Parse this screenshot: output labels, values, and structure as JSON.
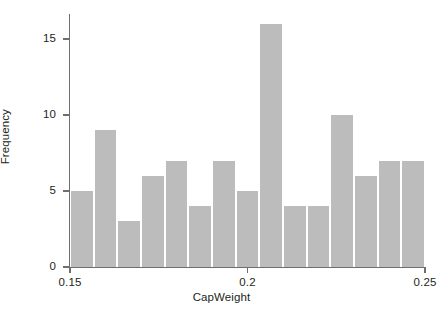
{
  "chart_data": {
    "type": "bar",
    "title": "",
    "subtitle": "",
    "xlabel": "CapWeight",
    "ylabel": "Frequency",
    "grid": false,
    "legend": null,
    "xlim": [
      0.15,
      0.25
    ],
    "ylim": [
      0,
      16.6
    ],
    "x_tick_labels": [
      "0.15",
      "0.2",
      "0.25"
    ],
    "x_tick_values": [
      0.15,
      0.2,
      0.25
    ],
    "y_tick_labels": [
      "0",
      "5",
      "10",
      "15"
    ],
    "y_tick_values": [
      0,
      5,
      10,
      15
    ],
    "bin_width": 0.0066667,
    "bin_edges": [
      0.15,
      0.156667,
      0.163333,
      0.17,
      0.176667,
      0.183333,
      0.19,
      0.196667,
      0.203333,
      0.21,
      0.216667,
      0.223333,
      0.23,
      0.236667,
      0.243333,
      0.25
    ],
    "categories": [
      "0.150-0.157",
      "0.157-0.163",
      "0.163-0.170",
      "0.170-0.177",
      "0.177-0.183",
      "0.183-0.190",
      "0.190-0.197",
      "0.197-0.203",
      "0.203-0.210",
      "0.210-0.217",
      "0.217-0.223",
      "0.223-0.230",
      "0.230-0.237",
      "0.237-0.243",
      "0.243-0.250"
    ],
    "values": [
      5,
      9,
      3,
      6,
      7,
      4,
      7,
      5,
      16,
      4,
      4,
      10,
      6,
      7,
      7
    ],
    "bar_color": "#bcbcbc",
    "axis_color": "#6f6f6f",
    "text_color": "#231f20",
    "background": "#ffffff"
  },
  "axes": {
    "x_title": "CapWeight",
    "y_title": "Frequency"
  },
  "top_stub": ""
}
